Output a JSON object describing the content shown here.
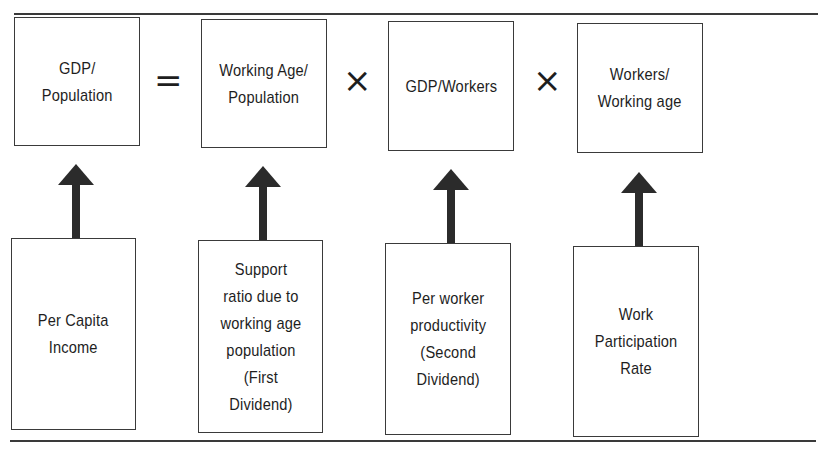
{
  "diagram": {
    "equation_row": [
      {
        "id": "gdp-population",
        "label": "GDP/\nPopulation"
      },
      {
        "id": "working-age-population",
        "label": "Working Age/\nPopulation"
      },
      {
        "id": "gdp-workers",
        "label": "GDP/Workers"
      },
      {
        "id": "workers-working-age",
        "label": "Workers/\nWorking age"
      }
    ],
    "operators": [
      "=",
      "×",
      "×"
    ],
    "interpretation_row": [
      {
        "id": "per-capita-income",
        "label": "Per Capita\nIncome"
      },
      {
        "id": "support-ratio",
        "label": "Support\nratio due to\nworking age\npopulation\n(First\nDividend)"
      },
      {
        "id": "per-worker-productivity",
        "label": "Per worker\nproductivity\n(Second\nDividend)"
      },
      {
        "id": "work-participation-rate",
        "label": "Work\nParticipation\nRate"
      }
    ],
    "arrow_color": "#2b2b2b",
    "line_color": "#3a3a3a"
  }
}
